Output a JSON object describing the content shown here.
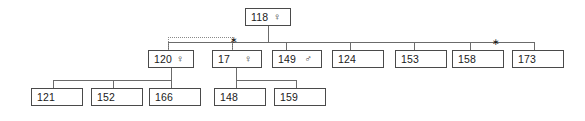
{
  "diagram": {
    "type": "pedigree-tree",
    "symbols": {
      "female": "♀",
      "male": "♂",
      "marker": "∗"
    },
    "colors": {
      "background": "#ffffff",
      "box_border": "#4a4a4a",
      "line": "#6b6b6b",
      "dotted_line": "#8a8a8a",
      "text": "#1a1a1a"
    },
    "generations": [
      {
        "level": 1,
        "nodes": [
          {
            "id": "118",
            "label": "118",
            "sex": "female",
            "sex_symbol": "♀"
          }
        ]
      },
      {
        "level": 2,
        "nodes": [
          {
            "id": "120",
            "label": "120",
            "sex": "female",
            "sex_symbol": "♀"
          },
          {
            "id": "17",
            "label": "17",
            "sex": "female",
            "sex_symbol": "♀"
          },
          {
            "id": "149",
            "label": "149",
            "sex": "male",
            "sex_symbol": "♂"
          },
          {
            "id": "124",
            "label": "124",
            "sex": "unknown",
            "sex_symbol": ""
          },
          {
            "id": "153",
            "label": "153",
            "sex": "unknown",
            "sex_symbol": ""
          },
          {
            "id": "158",
            "label": "158",
            "sex": "unknown",
            "sex_symbol": ""
          },
          {
            "id": "173",
            "label": "173",
            "sex": "unknown",
            "sex_symbol": ""
          }
        ]
      },
      {
        "level": 3,
        "nodes": [
          {
            "id": "121",
            "label": "121",
            "sex": "unknown",
            "sex_symbol": ""
          },
          {
            "id": "152",
            "label": "152",
            "sex": "unknown",
            "sex_symbol": ""
          },
          {
            "id": "166",
            "label": "166",
            "sex": "unknown",
            "sex_symbol": ""
          },
          {
            "id": "148",
            "label": "148",
            "sex": "unknown",
            "sex_symbol": ""
          },
          {
            "id": "159",
            "label": "159",
            "sex": "unknown",
            "sex_symbol": ""
          }
        ]
      }
    ],
    "markers": [
      {
        "id": "marker-1",
        "glyph": "∗",
        "near": "17"
      },
      {
        "id": "marker-2",
        "glyph": "∗",
        "near": "158-173"
      }
    ]
  }
}
